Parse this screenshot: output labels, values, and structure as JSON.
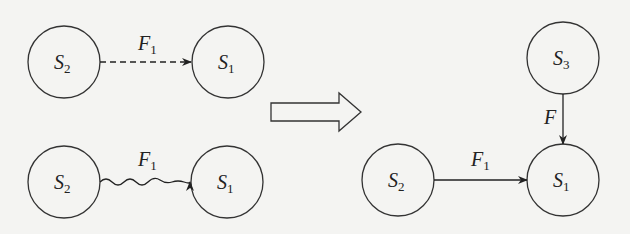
{
  "diagram": {
    "left_top": {
      "source": {
        "main": "S",
        "sub": "2"
      },
      "target": {
        "main": "S",
        "sub": "1"
      },
      "edge": {
        "main": "F",
        "sub": "1",
        "style": "dashed"
      }
    },
    "left_bottom": {
      "source": {
        "main": "S",
        "sub": "2"
      },
      "target": {
        "main": "S",
        "sub": "1"
      },
      "edge": {
        "main": "F",
        "sub": "1",
        "style": "wavy"
      }
    },
    "transition_arrow": "hollow-right-arrow",
    "right": {
      "top_node": {
        "main": "S",
        "sub": "3"
      },
      "left_node": {
        "main": "S",
        "sub": "2"
      },
      "center_node": {
        "main": "S",
        "sub": "1"
      },
      "vertical_edge": {
        "main": "F"
      },
      "horizontal_edge": {
        "main": "F",
        "sub": "1"
      }
    }
  }
}
